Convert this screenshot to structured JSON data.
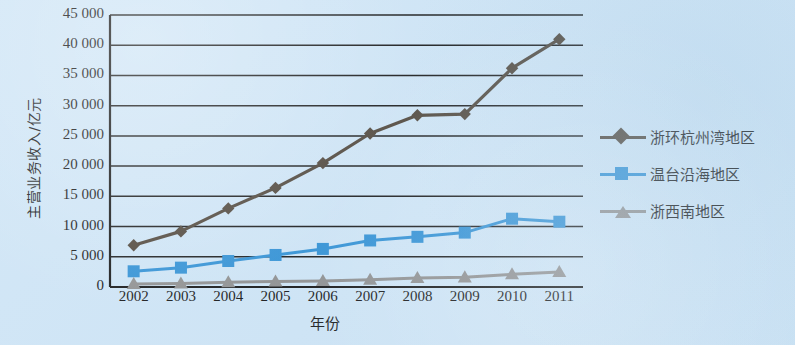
{
  "chart_data": {
    "type": "line",
    "title": "",
    "xlabel": "年份",
    "ylabel": "主营业务收入/亿元",
    "categories": [
      "2002",
      "2003",
      "2004",
      "2005",
      "2006",
      "2007",
      "2008",
      "2009",
      "2010",
      "2011"
    ],
    "ylim": [
      0,
      45000
    ],
    "ytick_step": 5000,
    "ytick_labels": [
      "45 000",
      "40 000",
      "35 000",
      "30 000",
      "25 000",
      "20 000",
      "15 000",
      "10 000",
      "5 000",
      "0"
    ],
    "ytick_values": [
      45000,
      40000,
      35000,
      30000,
      25000,
      20000,
      15000,
      10000,
      5000,
      0
    ],
    "grid": "horizontal",
    "legend_position": "right",
    "series": [
      {
        "name": "浙环杭州湾地区",
        "marker": "diamond",
        "color": "#4c4236",
        "values": [
          6900,
          9200,
          13000,
          16400,
          20500,
          25400,
          28400,
          28600,
          36200,
          41000
        ]
      },
      {
        "name": "温台沿海地区",
        "marker": "square",
        "color": "#2e8fd4",
        "values": [
          2600,
          3200,
          4300,
          5300,
          6300,
          7700,
          8300,
          9000,
          11300,
          10800
        ]
      },
      {
        "name": "浙西南地区",
        "marker": "triangle",
        "color": "#8e8e8e",
        "values": [
          500,
          600,
          800,
          900,
          1000,
          1200,
          1500,
          1600,
          2100,
          2500
        ]
      }
    ]
  },
  "axes": {
    "x_label": "年份",
    "y_label": "主营业务收入/亿元"
  },
  "colors": {
    "background": "#cfe5f6",
    "axis": "#121212",
    "grid": "#151515",
    "series_diamond": "#4c4236",
    "series_square": "#2e8fd4",
    "series_triangle": "#8e8e8e"
  }
}
